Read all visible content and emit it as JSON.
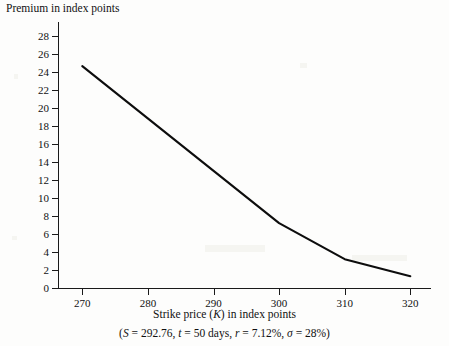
{
  "chart_data": {
    "type": "line",
    "title": "",
    "ylabel": "Premium in index points",
    "xlabel_plain": "Strike price (K) in index points",
    "xlabel_parts": {
      "before": "Strike price (",
      "variable": "K",
      "after": ") in index points"
    },
    "footnote_plain": "(S = 292.76, t = 50 days, r = 7.12%, σ = 28%)",
    "footnote_parts": [
      {
        "text": "(",
        "italic": false
      },
      {
        "text": "S",
        "italic": true
      },
      {
        "text": " = 292.76, ",
        "italic": false
      },
      {
        "text": "t",
        "italic": true
      },
      {
        "text": " = 50 days, ",
        "italic": false
      },
      {
        "text": "r",
        "italic": true
      },
      {
        "text": " = 7.12%, ",
        "italic": false
      },
      {
        "text": "σ",
        "italic": true
      },
      {
        "text": " = 28%)",
        "italic": false
      }
    ],
    "x": [
      270,
      300,
      310,
      320
    ],
    "y": [
      24.6,
      7.2,
      3.2,
      1.3
    ],
    "series": [
      {
        "name": "Call premium",
        "points": [
          {
            "x": 270,
            "y": 24.6
          },
          {
            "x": 300,
            "y": 7.2
          },
          {
            "x": 310,
            "y": 3.2
          },
          {
            "x": 320,
            "y": 1.3
          }
        ]
      }
    ],
    "xlim": [
      266.3,
      323.0
    ],
    "ylim": [
      0,
      29.5
    ],
    "xticks": [
      270,
      280,
      290,
      300,
      310,
      320
    ],
    "yticks": [
      0,
      2,
      4,
      6,
      8,
      10,
      12,
      14,
      16,
      18,
      20,
      22,
      24,
      26,
      28
    ],
    "grid": false,
    "legend": null,
    "line_color": "#0d0d0d",
    "axis_color": "#1a1a1a",
    "background_color": "#fdfdfc"
  }
}
